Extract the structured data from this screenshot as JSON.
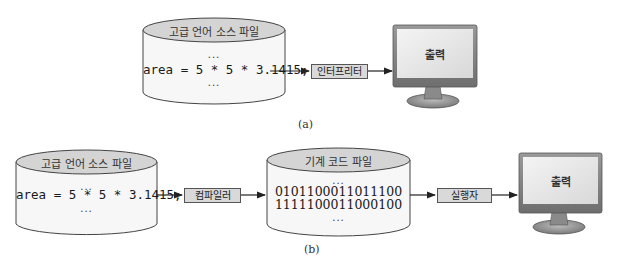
{
  "diagram_a": {
    "caption": "(a)",
    "source_file": {
      "title": "고급 언어 소스 파일",
      "dots_top": "...",
      "code": "area = 5 * 5 * 3.1415;",
      "dots_bottom": "..."
    },
    "processor": {
      "label": "인터프리터"
    },
    "output": {
      "label": "출력"
    }
  },
  "diagram_b": {
    "caption": "(b)",
    "source_file": {
      "title": "고급 언어 소스 파일",
      "dots_top": "...",
      "code": "area = 5 * 5 * 3.1415;",
      "dots_bottom": "..."
    },
    "compiler": {
      "label": "컴파일러"
    },
    "machine_file": {
      "title": "기계 코드 파일",
      "dots_top": "...",
      "lines": [
        "0101100011011100",
        "1111100011000100"
      ],
      "dots_bottom": "..."
    },
    "executor": {
      "label": "실행자"
    },
    "output": {
      "label": "출력"
    }
  },
  "colors": {
    "cylinder_top": "#d4d4d4",
    "cylinder_body": "#f7f7f7",
    "box_fill": "#d9d9d9",
    "monitor_bezel": "#8a8a8a",
    "monitor_screen": "#e6e6e6",
    "stroke": "#333333"
  }
}
